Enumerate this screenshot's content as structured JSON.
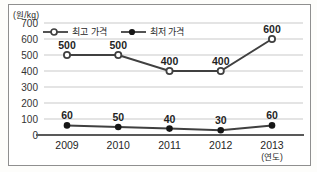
{
  "chart_data": {
    "type": "line",
    "title": "",
    "unit_label": "(원/kg)",
    "x_axis_note": "(연도)",
    "categories": [
      "2009",
      "2010",
      "2011",
      "2012",
      "2013"
    ],
    "yticks": [
      0,
      100,
      200,
      300,
      400,
      500,
      600,
      700
    ],
    "ylim": [
      0,
      700
    ],
    "grid": true,
    "legend_position": "top-inside",
    "series": [
      {
        "name": "최고 가격",
        "marker": "open-circle",
        "values": [
          500,
          500,
          400,
          400,
          600
        ]
      },
      {
        "name": "최저 가격",
        "marker": "filled-circle",
        "values": [
          60,
          50,
          40,
          30,
          60
        ]
      }
    ],
    "colors": {
      "line": "#404040",
      "marker_fill_open": "#ffffff",
      "marker_fill_solid": "#161616",
      "grid": "#c9c9c9",
      "axis": "#595959",
      "text": "#262626",
      "frame_border": "#8f8f8f",
      "background": "#ffffff"
    }
  }
}
